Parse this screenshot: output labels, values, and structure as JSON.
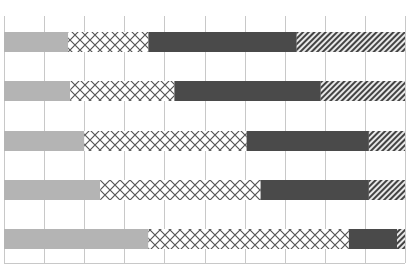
{
  "chart_data": {
    "type": "bar",
    "orientation": "horizontal",
    "stacked": true,
    "normalized_percent": true,
    "title": "",
    "xlabel": "",
    "ylabel": "",
    "xlim": [
      0,
      100
    ],
    "x_gridlines": [
      0,
      10,
      20,
      30,
      40,
      50,
      60,
      70,
      80,
      90,
      100
    ],
    "grid": true,
    "legend": null,
    "tick_labels_visible": false,
    "categories": [
      "Bar 1",
      "Bar 2",
      "Bar 3",
      "Bar 4",
      "Bar 5"
    ],
    "series": [
      {
        "name": "Segment 1",
        "fill": "light-gray-solid",
        "color": "#b4b4b4",
        "values": [
          16,
          16.5,
          20,
          24,
          36
        ]
      },
      {
        "name": "Segment 2",
        "fill": "crosshatch",
        "color": "#555555",
        "values": [
          20,
          26,
          40.5,
          40,
          50
        ]
      },
      {
        "name": "Segment 3",
        "fill": "dark-gray-solid",
        "color": "#4a4a4a",
        "values": [
          37,
          36.5,
          30.5,
          27,
          12
        ]
      },
      {
        "name": "Segment 4",
        "fill": "diagonal-hatch",
        "color": "#4a4a4a",
        "values": [
          27,
          21,
          9,
          9,
          2
        ]
      }
    ]
  },
  "colors": {
    "background": "#ffffff",
    "grid": "#c8c8c8",
    "light": "#b4b4b4",
    "dark": "#4a4a4a",
    "hatch_line": "#555555"
  }
}
